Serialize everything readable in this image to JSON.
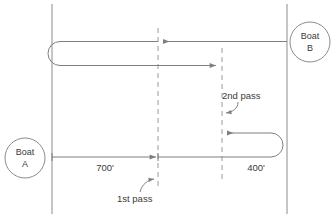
{
  "diagram": {
    "colors": {
      "line": "#7f7f7f",
      "dashed": "#9a9a9a",
      "border": "#8c8c8c",
      "text": "#3b3b3b",
      "background": "#ffffff"
    },
    "nodes": [
      {
        "id": "boat-a",
        "name": "boat-a-marker",
        "line1": "Boat",
        "line2": "A",
        "cx": 25,
        "cy": 158,
        "r": 20
      },
      {
        "id": "boat-b",
        "name": "boat-b-marker",
        "line1": "Boat",
        "line2": "B",
        "cx": 310,
        "cy": 42,
        "r": 20
      }
    ],
    "dimensions": [
      {
        "id": "dim-700",
        "label": "700'",
        "x": 105,
        "y": 170
      },
      {
        "id": "dim-400",
        "label": "400'",
        "x": 256,
        "y": 170
      }
    ],
    "annotations": [
      {
        "id": "first-pass",
        "label": "1st pass",
        "x": 117,
        "y": 202
      },
      {
        "id": "second-pass",
        "label": "2nd pass",
        "x": 222,
        "y": 99
      }
    ],
    "passLines": [
      {
        "id": "pass-line-1",
        "x": 158,
        "y1": 28,
        "y2": 190
      },
      {
        "id": "pass-line-2",
        "x": 222,
        "y1": 48,
        "y2": 180
      }
    ],
    "banks": [
      {
        "id": "bank-left",
        "x": 52,
        "y1": 4,
        "y2": 214
      },
      {
        "id": "bank-right",
        "x": 287,
        "y1": 4,
        "y2": 214
      }
    ]
  }
}
